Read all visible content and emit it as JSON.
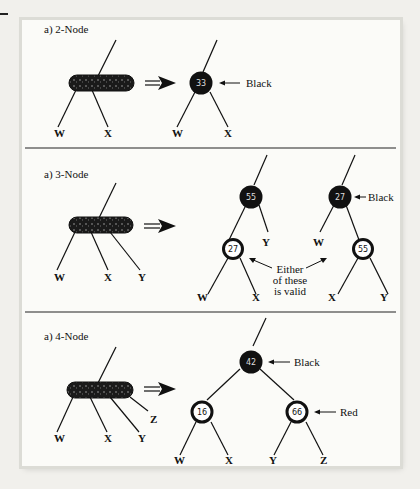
{
  "figure": {
    "panels": [
      {
        "title": "a) 2-Node",
        "leaves_234": [
          "W",
          "X"
        ],
        "rb_trees": [
          {
            "root": {
              "value": "33",
              "color": "black",
              "annotation": "Black"
            },
            "leaves": [
              "W",
              "X"
            ]
          }
        ]
      },
      {
        "title": "a) 3-Node",
        "leaves_234": [
          "W",
          "X",
          "Y"
        ],
        "rb_trees": [
          {
            "root": {
              "value": "55",
              "color": "black"
            },
            "left_child": {
              "value": "27",
              "color": "red"
            },
            "leaves": [
              "W",
              "X",
              "Y"
            ]
          },
          {
            "root": {
              "value": "27",
              "color": "black",
              "annotation": "Black"
            },
            "right_child": {
              "value": "55",
              "color": "red"
            },
            "leaves": [
              "W",
              "X",
              "Y"
            ]
          }
        ],
        "note_line1": "Either",
        "note_line2": "of these",
        "note_line3": "is valid"
      },
      {
        "title": "a) 4-Node",
        "leaves_234": [
          "W",
          "X",
          "Y",
          "Z"
        ],
        "rb_trees": [
          {
            "root": {
              "value": "42",
              "color": "black",
              "annotation": "Black"
            },
            "left_child": {
              "value": "16",
              "color": "red"
            },
            "right_child": {
              "value": "66",
              "color": "red",
              "annotation": "Red"
            },
            "leaves": [
              "W",
              "X",
              "Y",
              "Z"
            ]
          }
        ]
      }
    ]
  }
}
